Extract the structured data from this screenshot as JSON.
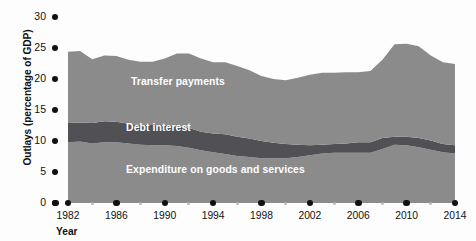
{
  "chart_data": {
    "type": "area",
    "title": "",
    "xlabel": "Year",
    "ylabel": "Outlays (percentage of GDP)",
    "stacked": true,
    "grid": false,
    "legend_position": "in-plot",
    "xlim": [
      1982,
      2014
    ],
    "ylim": [
      0,
      30
    ],
    "yticks": [
      0,
      5,
      10,
      15,
      20,
      25,
      30
    ],
    "ytick_labels": [
      "0",
      "5",
      "10",
      "15",
      "20",
      "25",
      "30"
    ],
    "xticks_major": [
      1982,
      1986,
      1990,
      1994,
      1998,
      2002,
      2006,
      2010,
      2014
    ],
    "xtick_labels": [
      "1982",
      "1986",
      "1990",
      "1994",
      "1998",
      "2002",
      "2006",
      "2010",
      "2014"
    ],
    "xticks_minor": [
      1984,
      1988,
      1992,
      1996,
      2000,
      2004,
      2008,
      2012
    ],
    "x": [
      1982,
      1983,
      1984,
      1985,
      1986,
      1987,
      1988,
      1989,
      1990,
      1991,
      1992,
      1993,
      1994,
      1995,
      1996,
      1997,
      1998,
      1999,
      2000,
      2001,
      2002,
      2003,
      2004,
      2005,
      2006,
      2007,
      2008,
      2009,
      2010,
      2011,
      2012,
      2013,
      2014
    ],
    "series": [
      {
        "name": "Expenditure on goods and services",
        "color": "#8b8b8b",
        "values": [
          9.8,
          9.9,
          9.6,
          9.8,
          9.8,
          9.6,
          9.4,
          9.3,
          9.3,
          9.2,
          8.9,
          8.5,
          8.2,
          7.9,
          7.6,
          7.4,
          7.2,
          7.2,
          7.2,
          7.4,
          7.7,
          8.0,
          8.1,
          8.1,
          8.1,
          8.1,
          8.7,
          9.4,
          9.3,
          9.0,
          8.6,
          8.2,
          8.0
        ]
      },
      {
        "name": "Debt interest",
        "color": "#505055",
        "values": [
          3.1,
          3.1,
          3.3,
          3.4,
          3.3,
          3.2,
          3.2,
          3.3,
          3.3,
          3.3,
          3.2,
          3.0,
          3.0,
          3.2,
          3.1,
          3.0,
          2.8,
          2.5,
          2.3,
          2.0,
          1.6,
          1.4,
          1.4,
          1.5,
          1.7,
          1.7,
          1.8,
          1.3,
          1.4,
          1.5,
          1.5,
          1.3,
          1.3
        ]
      },
      {
        "name": "Transfer payments",
        "color": "#8b8b8b",
        "values": [
          11.5,
          11.5,
          10.3,
          10.6,
          10.6,
          10.3,
          10.2,
          10.2,
          10.7,
          11.6,
          12.0,
          11.8,
          11.5,
          11.6,
          11.4,
          11.0,
          10.5,
          10.3,
          10.3,
          10.8,
          11.4,
          11.6,
          11.5,
          11.5,
          11.3,
          11.5,
          12.6,
          14.9,
          15.0,
          14.8,
          13.7,
          13.2,
          13.1
        ]
      }
    ],
    "series_labels": [
      {
        "text": "Transfer payments",
        "x": 1987.2,
        "y": 19.3
      },
      {
        "text": "Debt interest",
        "x": 1986.8,
        "y": 11.9
      },
      {
        "text": "Expenditure on goods and services",
        "x": 1986.8,
        "y": 5.2
      }
    ]
  },
  "colors": {
    "fill_light": "#8b8b8b",
    "fill_dark": "#505055",
    "axis_dot": "#111111",
    "minor_dot": "#b9b9b9",
    "label_text": "#ffffff",
    "background": "#fdfdfd"
  }
}
